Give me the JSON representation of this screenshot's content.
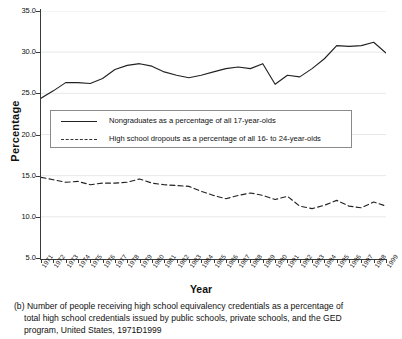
{
  "figure": {
    "panel_letter": "(b)",
    "ylabel": "Percentage",
    "xlabel": "Year",
    "caption_lines": [
      "(b) Number of people receiving high school equivalency credentials as a percentage of",
      "total high school credentials issued by public schools, private schools, and the GED",
      "program, United States, 1971Ð1999"
    ]
  },
  "legend": {
    "items": [
      {
        "key": "solid",
        "label": "Nongraduates as a percentage of all 17-year-olds"
      },
      {
        "key": "dashed",
        "label": "High school dropouts as a percentage of all 16- to 24-year-olds"
      }
    ]
  },
  "colors": {
    "line": "#222222",
    "grid": "#e8e8e8",
    "axis": "#3a3a3a",
    "background": "#ffffff"
  },
  "chart_data": {
    "type": "line",
    "title": "",
    "subtitle": "",
    "xlabel": "Year",
    "ylabel": "Percentage",
    "xlim": [
      1971,
      1999
    ],
    "ylim": [
      5.0,
      35.0
    ],
    "yticks": [
      5.0,
      10.0,
      15.0,
      20.0,
      25.0,
      30.0,
      35.0
    ],
    "ytick_labels": [
      "5.0",
      "10.0",
      "15.0",
      "20.0",
      "25.0",
      "30.0",
      "35.0"
    ],
    "grid": true,
    "legend_position": "center-left",
    "categories": [
      "1971",
      "1972",
      "1973",
      "1974",
      "1975",
      "1976",
      "1977",
      "1978",
      "1979",
      "1980",
      "1981",
      "1982",
      "1983",
      "1984",
      "1985",
      "1986",
      "1987",
      "1988",
      "1989",
      "1990",
      "1991",
      "1992",
      "1993",
      "1994",
      "1995",
      "1996",
      "1997",
      "1998",
      "1999"
    ],
    "x": [
      1971,
      1972,
      1973,
      1974,
      1975,
      1976,
      1977,
      1978,
      1979,
      1980,
      1981,
      1982,
      1983,
      1984,
      1985,
      1986,
      1987,
      1988,
      1989,
      1990,
      1991,
      1992,
      1993,
      1994,
      1995,
      1996,
      1997,
      1998,
      1999
    ],
    "series": [
      {
        "name": "Nongraduates as a percentage of all 17-year-olds",
        "style": "solid",
        "values": [
          24.4,
          25.3,
          26.3,
          26.3,
          26.2,
          26.8,
          27.9,
          28.4,
          28.6,
          28.3,
          27.6,
          27.2,
          26.9,
          27.2,
          27.6,
          28.0,
          28.2,
          28.0,
          28.6,
          26.1,
          27.2,
          27.0,
          28.0,
          29.2,
          30.8,
          30.7,
          30.8,
          31.2,
          29.9
        ]
      },
      {
        "name": "High school dropouts as a percentage of all 16- to 24-year-olds",
        "style": "dashed",
        "values": [
          14.8,
          14.5,
          14.2,
          14.3,
          13.9,
          14.1,
          14.1,
          14.2,
          14.6,
          14.1,
          13.9,
          13.8,
          13.7,
          13.1,
          12.6,
          12.2,
          12.6,
          12.9,
          12.6,
          12.1,
          12.5,
          11.3,
          11.0,
          11.4,
          12.0,
          11.3,
          11.1,
          11.8,
          11.3
        ]
      }
    ]
  }
}
